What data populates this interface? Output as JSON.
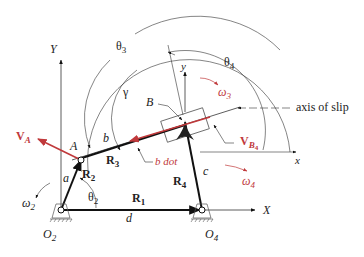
{
  "diagram": {
    "colors": {
      "link": "#111111",
      "thin": "#333333",
      "velocity": "#c0393b",
      "ground": "#555555"
    },
    "labels": {
      "Y_global": "Y",
      "X_global": "X",
      "theta3": "θ",
      "theta3_sub": "3",
      "theta4": "θ",
      "theta4_sub": "4",
      "gamma": "γ",
      "B": "B",
      "y_local": "y",
      "x_local": "x",
      "omega3": "ω",
      "omega3_sub": "3",
      "axis_of_slip": "axis of slip",
      "VA": "V",
      "VA_sub": "A",
      "A": "A",
      "b": "b",
      "R3": "R",
      "R3_sub": "3",
      "b_dot": "b dot",
      "VB4": "V",
      "VB4_sub": "B",
      "VB4_subsub": "4",
      "R2": "R",
      "R2_sub": "2",
      "a": "a",
      "R4": "R",
      "R4_sub": "4",
      "c": "c",
      "omega4": "ω",
      "omega4_sub": "4",
      "omega2": "ω",
      "omega2_sub": "2",
      "theta2": "θ",
      "theta2_sub": "2",
      "R1": "R",
      "R1_sub": "1",
      "d": "d",
      "O2": "O",
      "O2_sub": "2",
      "O4": "O",
      "O4_sub": "4"
    }
  }
}
